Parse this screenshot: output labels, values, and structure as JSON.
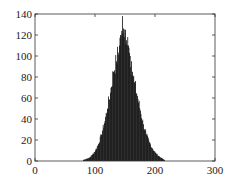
{
  "chart_data": {
    "type": "bar",
    "title": "",
    "xlabel": "",
    "ylabel": "",
    "xlim": [
      0,
      300
    ],
    "ylim": [
      0,
      140
    ],
    "grid": false,
    "legend": null,
    "x_ticks": [
      0,
      100,
      200,
      300
    ],
    "y_ticks": [
      0,
      20,
      40,
      60,
      80,
      100,
      120,
      140
    ],
    "bar_color": "#000000",
    "x": [
      80,
      85,
      90,
      95,
      100,
      105,
      110,
      115,
      120,
      125,
      130,
      135,
      140,
      142,
      144,
      145,
      146,
      148,
      150,
      152,
      154,
      155,
      156,
      158,
      160,
      162,
      165,
      170,
      175,
      180,
      185,
      190,
      195,
      200,
      205,
      210,
      215
    ],
    "values": [
      1,
      2,
      3,
      6,
      10,
      16,
      25,
      36,
      50,
      65,
      85,
      95,
      110,
      120,
      124,
      138,
      122,
      118,
      125,
      115,
      118,
      110,
      108,
      100,
      95,
      85,
      75,
      62,
      48,
      35,
      25,
      18,
      12,
      8,
      5,
      3,
      1
    ]
  }
}
